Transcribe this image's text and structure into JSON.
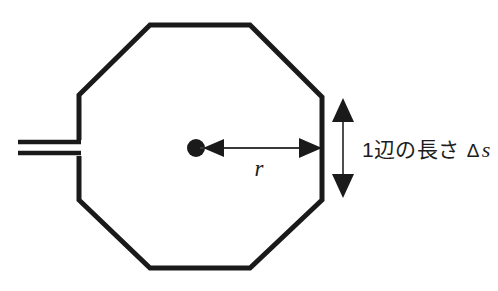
{
  "figure": {
    "background_color": "#ffffff",
    "stroke_color": "#1a1a1a",
    "width": 498,
    "height": 291
  },
  "shape": {
    "name": "octagon",
    "sides": 8,
    "vertices": [
      [
        150,
        25
      ],
      [
        250,
        25
      ],
      [
        322,
        97
      ],
      [
        322,
        200
      ],
      [
        250,
        268
      ],
      [
        150,
        268
      ],
      [
        79,
        200
      ],
      [
        79,
        95
      ]
    ]
  },
  "center_marker": {
    "label": "center-point",
    "cx": 196,
    "cy": 148,
    "r": 9,
    "color": "#1a1a1a"
  },
  "stem": {
    "label": "lead-lines",
    "line_count": 2,
    "x_start": 18,
    "x_end": 79,
    "y_top": 142,
    "y_bottom": 153
  },
  "radius_dimension": {
    "label": "r",
    "label_style": "italic-serif",
    "x_from": 196,
    "x_to": 322,
    "y": 148,
    "label_x": 259,
    "label_y": 172,
    "arrowheads": "both"
  },
  "side_dimension": {
    "label": "1辺の長さ Δs",
    "label_parts": {
      "japanese": "1辺の長さ",
      "delta": "Δ",
      "symbol": "s"
    },
    "x": 343,
    "y_top": 100,
    "y_bottom": 196,
    "arrowheads": "both",
    "label_x": 362,
    "label_y": 157
  }
}
